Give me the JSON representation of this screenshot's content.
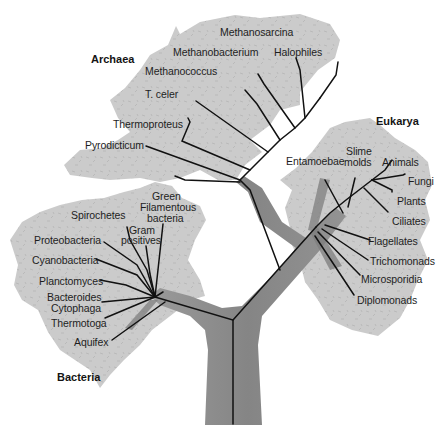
{
  "colors": {
    "background": "#ffffff",
    "crown": "#c9c9c9",
    "trunk": "#8e8e8e",
    "lines": "#111111",
    "text": "#1e1e1e"
  },
  "domains": {
    "archaea": {
      "label": "Archaea",
      "groups": [
        "Methanosarcina",
        "Methanobacterium",
        "Halophiles",
        "Methanococcus",
        "T. celer",
        "Thermoproteus",
        "Pyrodicticum"
      ]
    },
    "eukarya": {
      "label": "Eukarya",
      "groups": [
        "Entamoebae",
        "Slime",
        "molds",
        "Animals",
        "Fungi",
        "Plants",
        "Ciliates",
        "Flagellates",
        "Trichomonads",
        "Microsporidia",
        "Diplomonads"
      ]
    },
    "bacteria": {
      "label": "Bacteria",
      "groups": [
        "Green",
        "Filamentous",
        "bacteria",
        "Spirochetes",
        "Gram",
        "positives",
        "Proteobacteria",
        "Cyanobacteria",
        "Planctomyces",
        "Bacteroides",
        "Cytophaga",
        "Thermotoga",
        "Aquifex"
      ]
    }
  }
}
